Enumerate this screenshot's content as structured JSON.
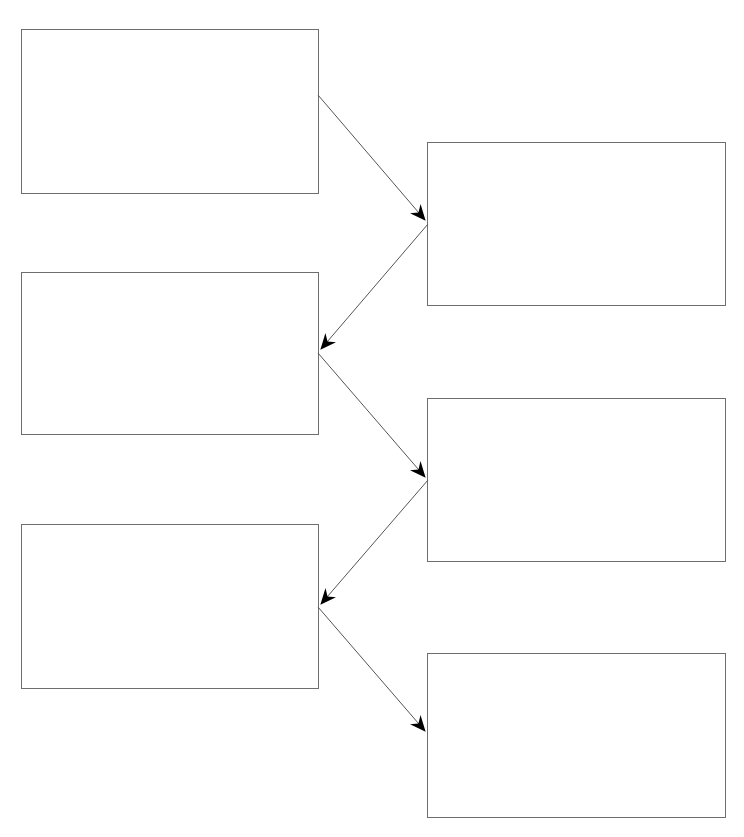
{
  "diagram": {
    "type": "zigzag-flowchart",
    "canvas": {
      "width": 744,
      "height": 837,
      "background": "#ffffff"
    },
    "colors": {
      "box_border": "#6e6e6e",
      "arrow_line": "#555555",
      "arrow_head": "#000000"
    },
    "boxes": [
      {
        "id": "box-1",
        "label": "",
        "x": 21,
        "y": 29,
        "w": 298,
        "h": 165
      },
      {
        "id": "box-2",
        "label": "",
        "x": 427,
        "y": 142,
        "w": 299,
        "h": 164
      },
      {
        "id": "box-3",
        "label": "",
        "x": 21,
        "y": 272,
        "w": 298,
        "h": 163
      },
      {
        "id": "box-4",
        "label": "",
        "x": 427,
        "y": 398,
        "w": 299,
        "h": 164
      },
      {
        "id": "box-5",
        "label": "",
        "x": 21,
        "y": 524,
        "w": 298,
        "h": 165
      },
      {
        "id": "box-6",
        "label": "",
        "x": 427,
        "y": 653,
        "w": 299,
        "h": 165
      }
    ],
    "arrows": [
      {
        "from": "box-1",
        "to": "box-2",
        "x1": 318,
        "y1": 95,
        "x2": 425,
        "y2": 220
      },
      {
        "from": "box-2",
        "to": "box-3",
        "x1": 428,
        "y1": 224,
        "x2": 321,
        "y2": 349
      },
      {
        "from": "box-3",
        "to": "box-4",
        "x1": 318,
        "y1": 353,
        "x2": 425,
        "y2": 477
      },
      {
        "from": "box-4",
        "to": "box-5",
        "x1": 428,
        "y1": 480,
        "x2": 321,
        "y2": 604
      },
      {
        "from": "box-5",
        "to": "box-6",
        "x1": 318,
        "y1": 607,
        "x2": 425,
        "y2": 731
      }
    ]
  }
}
